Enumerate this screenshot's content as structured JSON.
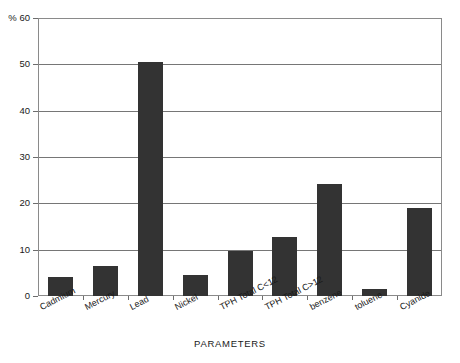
{
  "chart_data": {
    "type": "bar",
    "title": "",
    "subtitle": "",
    "xlabel": "PARAMETERS",
    "ylabel": "%",
    "ylim": [
      0,
      60
    ],
    "ytick_values": [
      0,
      10,
      20,
      30,
      40,
      50,
      60
    ],
    "ytick_labels": [
      "0",
      "10",
      "20",
      "30",
      "40",
      "50",
      "% 60"
    ],
    "grid": true,
    "legend": false,
    "legend_position": "none",
    "bar_color": "#333333",
    "frame_color": "#8a8a8a",
    "gridline_color": "#767676",
    "background_color": "#ffffff",
    "categories": [
      "Cadmium",
      "Mercury",
      "Lead",
      "Nickel",
      "TPH Total C<12",
      "TPH Total C>12",
      "benzene",
      "toluene",
      "Cyanide"
    ],
    "values": [
      4.2,
      6.5,
      50.5,
      4.5,
      9.7,
      12.8,
      24.1,
      1.5,
      19.1
    ]
  }
}
